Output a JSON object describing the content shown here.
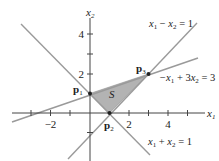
{
  "diagram": {
    "region_label": "S",
    "axes": {
      "x_label": "x",
      "x_sub": "1",
      "y_label": "x",
      "y_sub": "2",
      "x_ticks_labeled": [
        "−2",
        "2",
        "4"
      ],
      "y_ticks_labeled": [
        "2",
        "4"
      ]
    },
    "lines": [
      {
        "id": "l1",
        "text_a": "x",
        "sub_a": "1",
        "op": " − ",
        "text_b": "x",
        "sub_b": "2",
        "rhs": " = 1"
      },
      {
        "id": "l2",
        "text_pre": "−x",
        "sub_a": "1",
        "op": " + 3",
        "text_b": "x",
        "sub_b": "2",
        "rhs": " = 3"
      },
      {
        "id": "l3",
        "text_a": "x",
        "sub_a": "1",
        "op": " + ",
        "text_b": "x",
        "sub_b": "2",
        "rhs": " = 1"
      }
    ],
    "points": [
      {
        "label": "p",
        "sub": "1",
        "coords": [
          0,
          1
        ]
      },
      {
        "label": "p",
        "sub": "2",
        "coords": [
          1,
          0
        ]
      },
      {
        "label": "p",
        "sub": "3",
        "coords": [
          3,
          2
        ]
      }
    ],
    "colors": {
      "region_fill": "#b3b3b3",
      "line": "#999999",
      "axis": "#444444"
    }
  }
}
